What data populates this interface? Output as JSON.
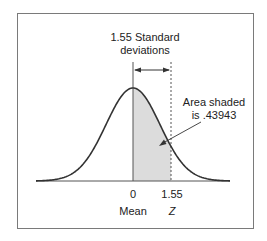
{
  "diagram": {
    "title_line1": "1.55 Standard",
    "title_line2": "deviations",
    "area_line1": "Area shaded",
    "area_line2": "is .43943",
    "tick_mean_value": "0",
    "tick_z_value": "1.55",
    "mean_label": "Mean",
    "z_label": "Z",
    "shaded_color": "#dcdcdc",
    "curve_color": "#333333"
  }
}
